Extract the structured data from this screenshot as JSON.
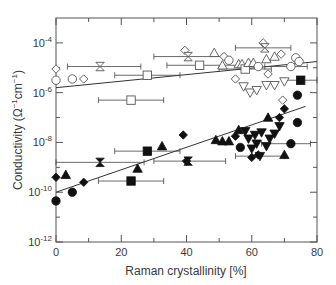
{
  "chart_data": {
    "type": "scatter",
    "title": "",
    "xlabel": "Raman crystallinity [%]",
    "ylabel": "Conductivity (Ω⁻¹cm⁻¹)",
    "ylabel_parts": {
      "main": "Conductivity (Ω",
      "sup1": "−1",
      "mid": "cm",
      "sup2": "−1",
      "end": ")"
    },
    "xlim": [
      0,
      80
    ],
    "ylim_log10": [
      -12,
      -3
    ],
    "yscale": "log",
    "grid": false,
    "legend": "none",
    "x_ticks": [
      0,
      20,
      40,
      60,
      80
    ],
    "x_minor_ticks": [
      10,
      30,
      50,
      70
    ],
    "y_ticks_log10": [
      -12,
      -10,
      -8,
      -6,
      -4
    ],
    "y_minor_ticks_log10": [
      -11,
      -9,
      -7,
      -5
    ],
    "y_tick_labels": [
      {
        "base": "10",
        "exp": "-12",
        "log": -12
      },
      {
        "base": "10",
        "exp": "-10",
        "log": -10
      },
      {
        "base": "10",
        "exp": "-8",
        "log": -8
      },
      {
        "base": "10",
        "exp": "-6",
        "log": -6
      },
      {
        "base": "10",
        "exp": "-4",
        "log": -4
      }
    ],
    "x_tick_labels": [
      "0",
      "20",
      "40",
      "60",
      "80"
    ],
    "fit_lines": [
      {
        "name": "open-symbols-fit",
        "x": [
          0,
          80
        ],
        "log10_y": [
          -5.8,
          -4.75
        ]
      },
      {
        "name": "filled-symbols-fit",
        "x": [
          0,
          76.5
        ],
        "log10_y": [
          -10.0,
          -6.55
        ]
      }
    ],
    "series": [
      {
        "name": "filled (dark conductivity)",
        "filled": true,
        "points": [
          {
            "m": "circle",
            "x": 0,
            "y": -10.35
          },
          {
            "m": "diamond",
            "x": 0,
            "y": -9.4
          },
          {
            "m": "triangle",
            "x": 3,
            "y": -9.3
          },
          {
            "m": "circle",
            "x": 5,
            "y": -10.0
          },
          {
            "m": "diamond",
            "x": 8.5,
            "y": -9.6
          },
          {
            "m": "hourglass",
            "x": 13.5,
            "y": -8.8,
            "xerr": [
              0,
              27
            ]
          },
          {
            "m": "square",
            "x": 23,
            "y": -9.55,
            "xerr": [
              13,
              33
            ]
          },
          {
            "m": "triangle",
            "x": 25,
            "y": -9.05
          },
          {
            "m": "square",
            "x": 28,
            "y": -8.35,
            "xerr": [
              18,
              38
            ]
          },
          {
            "m": "triangle",
            "x": 32.5,
            "y": -8.15
          },
          {
            "m": "diamond",
            "x": 39,
            "y": -7.7
          },
          {
            "m": "diamond",
            "x": 40,
            "y": -8.75
          },
          {
            "m": "hourglass",
            "x": 40.5,
            "y": -8.75,
            "xerr": [
              30,
              52
            ]
          },
          {
            "m": "triangle",
            "x": 49,
            "y": -7.9
          },
          {
            "m": "triangle",
            "x": 51,
            "y": -7.95
          },
          {
            "m": "triangle",
            "x": 53,
            "y": -7.95
          },
          {
            "m": "diamond",
            "x": 55,
            "y": -7.75
          },
          {
            "m": "triangle",
            "x": 56,
            "y": -7.5
          },
          {
            "m": "circle",
            "x": 56.5,
            "y": -8.2
          },
          {
            "m": "triangle-down",
            "x": 58,
            "y": -7.55
          },
          {
            "m": "triangle-down",
            "x": 59,
            "y": -7.85
          },
          {
            "m": "triangle-down",
            "x": 60,
            "y": -8.25
          },
          {
            "m": "diamond",
            "x": 60,
            "y": -8.6
          },
          {
            "m": "triangle-down",
            "x": 61,
            "y": -7.7
          },
          {
            "m": "triangle-down",
            "x": 61.5,
            "y": -8.05
          },
          {
            "m": "diamond",
            "x": 62,
            "y": -8.5
          },
          {
            "m": "triangle-down",
            "x": 62.5,
            "y": -8.55,
            "xerr": [
              55,
              70
            ]
          },
          {
            "m": "triangle-down",
            "x": 63,
            "y": -7.6
          },
          {
            "m": "triangle-down",
            "x": 64.5,
            "y": -8.15
          },
          {
            "m": "triangle-down",
            "x": 65.5,
            "y": -7.85
          },
          {
            "m": "triangle",
            "x": 65,
            "y": -7.0
          },
          {
            "m": "triangle-down",
            "x": 67,
            "y": -7.65
          },
          {
            "m": "triangle-down",
            "x": 68.5,
            "y": -7.35
          },
          {
            "m": "triangle",
            "x": 70,
            "y": -8.5
          },
          {
            "m": "diamond",
            "x": 68.5,
            "y": -7.0
          },
          {
            "m": "diamond",
            "x": 70,
            "y": -6.65
          },
          {
            "m": "circle",
            "x": 72,
            "y": -8.05,
            "xerr": [
              63,
              78
            ]
          },
          {
            "m": "circle",
            "x": 74,
            "y": -6.1
          },
          {
            "m": "circle",
            "x": 74,
            "y": -7.2
          },
          {
            "m": "square",
            "x": 75,
            "y": -5.5,
            "xerr": [
              70,
              80
            ]
          }
        ]
      },
      {
        "name": "open (photo conductivity)",
        "filled": false,
        "points": [
          {
            "m": "circle",
            "x": 0,
            "y": -5.5
          },
          {
            "m": "diamond",
            "x": 0,
            "y": -5.05
          },
          {
            "m": "circle",
            "x": 5,
            "y": -5.45
          },
          {
            "m": "diamond",
            "x": 8.5,
            "y": -5.45
          },
          {
            "m": "hourglass",
            "x": 13.5,
            "y": -4.95,
            "xerr": [
              3.5,
              26
            ]
          },
          {
            "m": "square",
            "x": 23,
            "y": -6.3,
            "xerr": [
              13,
              33
            ]
          },
          {
            "m": "square",
            "x": 28,
            "y": -5.3,
            "xerr": [
              18,
              38
            ]
          },
          {
            "m": "diamond",
            "x": 39.5,
            "y": -4.3
          },
          {
            "m": "hourglass",
            "x": 40.5,
            "y": -4.55,
            "xerr": [
              30,
              51
            ]
          },
          {
            "m": "square",
            "x": 44,
            "y": -4.9,
            "xerr": [
              34,
              56
            ]
          },
          {
            "m": "triangle",
            "x": 48.5,
            "y": -4.4
          },
          {
            "m": "triangle",
            "x": 51,
            "y": -4.9
          },
          {
            "m": "diamond",
            "x": 51.5,
            "y": -4.55
          },
          {
            "m": "circle",
            "x": 53,
            "y": -4.7
          },
          {
            "m": "diamond",
            "x": 55,
            "y": -5.45
          },
          {
            "m": "triangle",
            "x": 56,
            "y": -4.85
          },
          {
            "m": "triangle",
            "x": 57,
            "y": -4.85
          },
          {
            "m": "square",
            "x": 58,
            "y": -5.05,
            "xerr": [
              50,
              66
            ]
          },
          {
            "m": "triangle-down",
            "x": 57.5,
            "y": -5.75
          },
          {
            "m": "triangle-down",
            "x": 59.5,
            "y": -6.0
          },
          {
            "m": "triangle",
            "x": 59,
            "y": -4.8
          },
          {
            "m": "triangle",
            "x": 60.5,
            "y": -4.8
          },
          {
            "m": "triangle-down",
            "x": 61.5,
            "y": -5.9
          },
          {
            "m": "circle",
            "x": 62,
            "y": -4.95
          },
          {
            "m": "diamond",
            "x": 63.5,
            "y": -4.0
          },
          {
            "m": "hourglass",
            "x": 64,
            "y": -4.2,
            "xerr": [
              55,
              72
            ]
          },
          {
            "m": "triangle",
            "x": 64.5,
            "y": -4.65
          },
          {
            "m": "triangle-down",
            "x": 64.5,
            "y": -5.7
          },
          {
            "m": "diamond",
            "x": 65,
            "y": -5.25
          },
          {
            "m": "triangle-down",
            "x": 67,
            "y": -5.7
          },
          {
            "m": "triangle",
            "x": 67,
            "y": -4.55
          },
          {
            "m": "diamond",
            "x": 69,
            "y": -4.45
          },
          {
            "m": "triangle-down",
            "x": 70,
            "y": -5.55
          },
          {
            "m": "diamond",
            "x": 69.5,
            "y": -6.3
          },
          {
            "m": "circle",
            "x": 72,
            "y": -4.95,
            "xerr": [
              64,
              77
            ]
          },
          {
            "m": "circle",
            "x": 73.5,
            "y": -4.6
          },
          {
            "m": "circle",
            "x": 74.5,
            "y": -4.75
          }
        ]
      }
    ]
  },
  "colors": {
    "axis": "#555555",
    "marker": "#111111",
    "line": "#333333",
    "text": "#3a3a3a",
    "errorbar": "#444444",
    "open_marker_stroke": "#555555"
  }
}
